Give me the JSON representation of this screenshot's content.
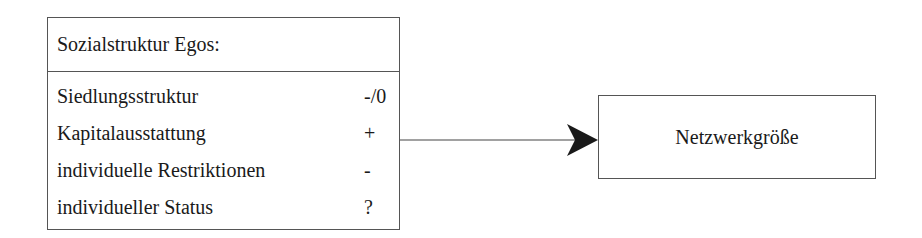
{
  "diagram": {
    "source_box": {
      "title": "Sozialstruktur Egos:",
      "rows": [
        {
          "label": "Siedlungsstruktur",
          "effect": "-/0"
        },
        {
          "label": "Kapitalausstattung",
          "effect": "+"
        },
        {
          "label": "individuelle Restriktionen",
          "effect": "-"
        },
        {
          "label": "individueller Status",
          "effect": "?"
        }
      ]
    },
    "target_box": {
      "label": "Netzwerkgröße"
    },
    "edge": {
      "from": "Sozialstruktur Egos",
      "to": "Netzwerkgröße",
      "type": "directed-arrow"
    }
  }
}
